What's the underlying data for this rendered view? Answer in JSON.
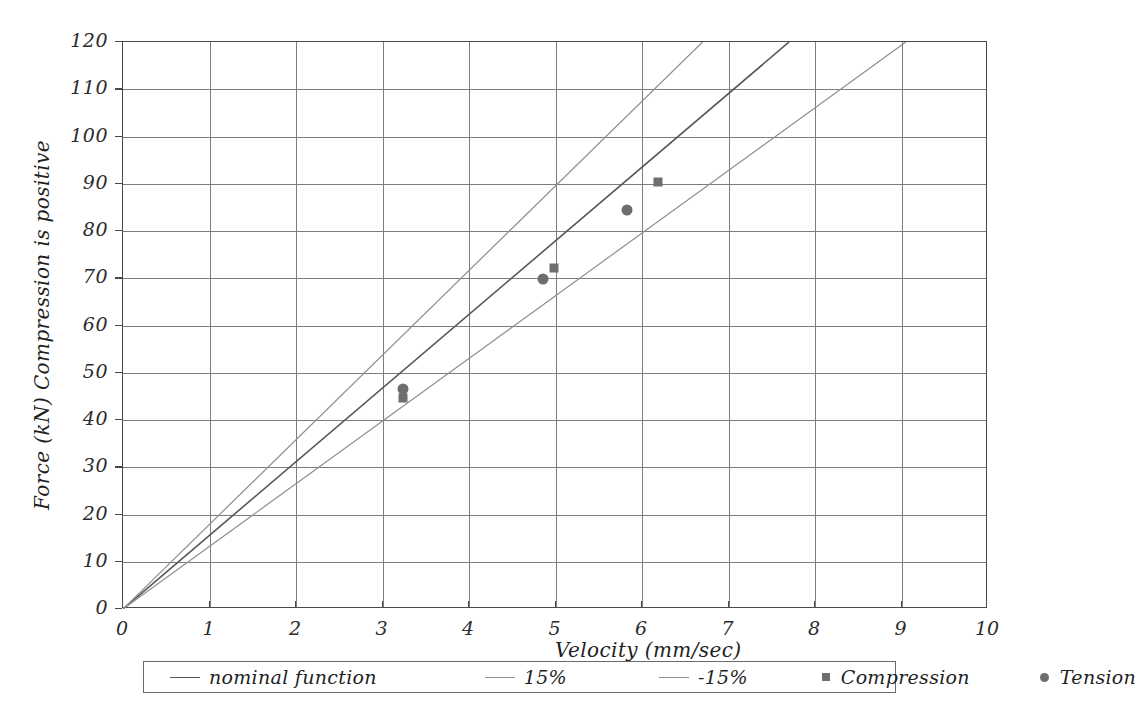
{
  "chart_data": {
    "type": "scatter",
    "title": "",
    "xlabel": "Velocity (mm/sec)",
    "ylabel": "Force (kN)  Compression is positive",
    "ylabel_part1": "Force (kN)",
    "ylabel_part2": "Compression is positive",
    "xlim": [
      0,
      10
    ],
    "ylim": [
      0,
      120
    ],
    "xticks": [
      0,
      1,
      2,
      3,
      4,
      5,
      6,
      7,
      8,
      9,
      10
    ],
    "xtick_labels": [
      "0",
      "1",
      "2",
      "3",
      "4",
      "5",
      "6",
      "7",
      "8",
      "9",
      "10"
    ],
    "yticks": [
      0,
      10,
      20,
      30,
      40,
      50,
      60,
      70,
      80,
      90,
      100,
      110,
      120
    ],
    "ytick_labels": [
      "0",
      "10",
      "20",
      "30",
      "40",
      "50",
      "60",
      "70",
      "80",
      "90",
      "100",
      "110",
      "120"
    ],
    "grid": true,
    "legend_position": "below",
    "series": [
      {
        "name": "nominal function",
        "kind": "line",
        "slope": 15.58,
        "intercept": 0,
        "color": "#555555",
        "points": [
          [
            0,
            0
          ],
          [
            7.7,
            120
          ]
        ]
      },
      {
        "name": "15%",
        "kind": "line",
        "slope": 17.91,
        "intercept": 0,
        "color": "#8e8e8e",
        "points": [
          [
            0,
            0
          ],
          [
            6.7,
            120
          ]
        ]
      },
      {
        "name": "-15%",
        "kind": "line",
        "slope": 13.26,
        "intercept": 0,
        "color": "#8e8e8e",
        "points": [
          [
            0,
            0
          ],
          [
            9.05,
            120
          ]
        ]
      },
      {
        "name": "Compression",
        "kind": "scatter",
        "marker": "square",
        "color": "#6e6e6e",
        "points": [
          [
            3.24,
            44.6
          ],
          [
            4.98,
            72.2
          ],
          [
            6.19,
            90.4
          ]
        ]
      },
      {
        "name": "Tension",
        "kind": "scatter",
        "marker": "circle",
        "color": "#6e6e6e",
        "points": [
          [
            3.24,
            46.6
          ],
          [
            4.86,
            69.8
          ],
          [
            5.83,
            84.5
          ]
        ]
      }
    ],
    "legend_entries": [
      {
        "label": "nominal function",
        "swatch": "line-dark"
      },
      {
        "label": "15%",
        "swatch": "line-light"
      },
      {
        "label": "-15%",
        "swatch": "line-dashed"
      },
      {
        "label": "Compression",
        "swatch": "square"
      },
      {
        "label": "Tension",
        "swatch": "circle"
      }
    ],
    "colors": {
      "nominal_line": "#555555",
      "tolerance_line": "#8e8e8e",
      "marker": "#6e6e6e",
      "grid": "#7d7d7d",
      "axis": "#4a4a4a",
      "text": "#1f1f1f",
      "background": "#ffffff"
    }
  }
}
